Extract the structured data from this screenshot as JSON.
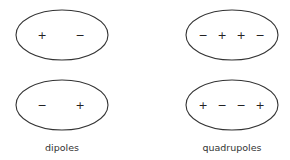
{
  "diagram": {
    "groups": [
      {
        "label": "dipoles",
        "shapes": [
          {
            "name": "dipole-top",
            "signs": [
              "+",
              "−"
            ]
          },
          {
            "name": "dipole-bottom",
            "signs": [
              "−",
              "+"
            ]
          }
        ]
      },
      {
        "label": "quadrupoles",
        "shapes": [
          {
            "name": "quadrupole-top",
            "signs": [
              "−",
              "+",
              "+",
              "−"
            ]
          },
          {
            "name": "quadrupole-bottom",
            "signs": [
              "+",
              "−",
              "−",
              "+"
            ]
          }
        ]
      }
    ]
  }
}
